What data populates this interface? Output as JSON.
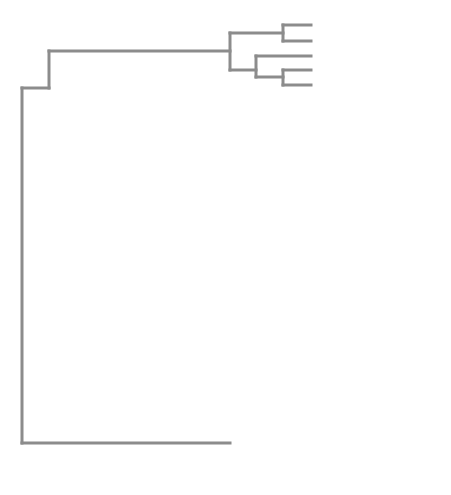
{
  "figure": {
    "type": "phylogenetic-tree",
    "colors": {
      "branch": "#8c8c8c",
      "highlight_branch": "#1a1a1a",
      "marker_filled": "#111111",
      "marker_grey": "#aaaaaa",
      "marker_open": "#ffffff"
    }
  },
  "leaves": [
    {
      "name": "agelas",
      "quoted": false,
      "suffix": "",
      "marker": "none",
      "y": 25
    },
    {
      "name": "mcclendoni",
      "quoted": false,
      "suffix": "",
      "marker": "none",
      "y": 41
    },
    {
      "name": "pectiniger",
      "quoted": false,
      "suffix": "",
      "marker": "open",
      "y": 56
    },
    {
      "name": "sanctithomae",
      "quoted": false,
      "suffix": "",
      "marker": "open",
      "y": 70
    },
    {
      "name": "williamsi",
      "quoted": false,
      "suffix": "",
      "marker": "open",
      "y": 85
    },
    {
      "name": "anasimus",
      "quoted": false,
      "suffix": "",
      "marker": "none",
      "y": 100
    },
    {
      "name": "occidentalis (?)",
      "quoted": false,
      "suffix": "",
      "marker": "none",
      "y": 115
    },
    {
      "name": "goodei",
      "quoted": false,
      "suffix": "",
      "marker": "open",
      "y": 130
    },
    {
      "name": "pandionis",
      "quoted": true,
      "suffix": " giant",
      "marker": "open",
      "y": 145
    },
    {
      "name": "pandionis",
      "quoted": true,
      "suffix": " red",
      "marker": "none",
      "y": 160
    },
    {
      "name": "pandionis",
      "quoted": false,
      "suffix": "",
      "marker": "open",
      "y": 175
    },
    {
      "name": "longicarpus",
      "quoted": false,
      "suffix": "",
      "marker": "open",
      "y": 190
    },
    {
      "name": "pandionis",
      "quoted": true,
      "suffix": " small",
      "marker": "open",
      "y": 205
    },
    {
      "name": "longicarpus",
      "quoted": true,
      "suffix": " small",
      "marker": "none",
      "y": 220
    },
    {
      "name": "filidigitus",
      "quoted": false,
      "suffix": "",
      "marker": "filled",
      "y": 234
    },
    {
      "name": "regalis",
      "quoted": false,
      "suffix": "",
      "marker": "filled",
      "y": 249
    },
    {
      "name": "rathbunae",
      "quoted": true,
      "suffix": " A",
      "marker": "filled",
      "y": 264
    },
    {
      "name": "rathbunae",
      "quoted": false,
      "suffix": "",
      "marker": "filled",
      "y": 279
    },
    {
      "name": "bousfieldi",
      "quoted": true,
      "suffix": " A",
      "marker": "none",
      "y": 294
    },
    {
      "name": "bousfieldi",
      "quoted": true,
      "suffix": " blade",
      "marker": "none",
      "y": 309
    },
    {
      "name": "chacei",
      "quoted": false,
      "suffix": "",
      "marker": "filled",
      "y": 323
    },
    {
      "name": "chacei",
      "quoted": true,
      "suffix": " A",
      "marker": "none",
      "y": 338
    },
    {
      "name": "brooksi",
      "quoted": true,
      "suffix": " D",
      "marker": "grey",
      "y": 353
    },
    {
      "name": "brooksi",
      "quoted": false,
      "suffix": "",
      "marker": "filled",
      "y": 368
    },
    {
      "name": "brevifrons",
      "quoted": false,
      "suffix": "",
      "marker": "none",
      "y": 383
    },
    {
      "name": "herricki",
      "quoted": false,
      "suffix": "",
      "marker": "none",
      "y": 397
    },
    {
      "name": "androsi",
      "quoted": false,
      "suffix": "",
      "marker": "open",
      "y": 412
    },
    {
      "name": "gambarelloides",
      "quoted": false,
      "suffix": "",
      "marker": "none",
      "y": 427
    },
    {
      "name": "intermediate",
      "quoted": true,
      "suffix": "",
      "marker": "none",
      "y": 441
    },
    {
      "name": "paraneptunus",
      "quoted": false,
      "suffix": "",
      "marker": "open",
      "y": 456
    },
    {
      "name": "paraneptunus",
      "quoted": true,
      "suffix": " small",
      "marker": "none",
      "y": 471
    }
  ],
  "support_values": [
    {
      "value": "60",
      "x": 263,
      "y": 29
    },
    {
      "value": "85",
      "x": 263,
      "y": 77
    },
    {
      "value": "77",
      "x": 106,
      "y": 42
    },
    {
      "value": "100",
      "x": 234,
      "y": 164
    },
    {
      "value": "99",
      "x": 269,
      "y": 238
    },
    {
      "value": "100",
      "x": 233,
      "y": 256
    },
    {
      "value": "100",
      "x": 259,
      "y": 270
    },
    {
      "value": "53",
      "x": 210,
      "y": 310
    },
    {
      "value": "100",
      "x": 263,
      "y": 314
    },
    {
      "value": "100",
      "x": 236,
      "y": 327
    },
    {
      "value": "92",
      "x": 181,
      "y": 336
    },
    {
      "value": "81",
      "x": 263,
      "y": 360
    },
    {
      "value": "94",
      "x": 237,
      "y": 452
    },
    {
      "value": "100",
      "x": 263,
      "y": 465
    }
  ],
  "branches": [
    {
      "d": "M49 51 V443 M49 51 H230 M49 443 H230",
      "dark": false
    },
    {
      "d": "M230 33 V70 M230 33 H283 M230 70 H256",
      "dark": false
    },
    {
      "d": "M283 25 V41 M283 25 H311 M283 41 H311",
      "dark": false
    },
    {
      "d": "M256 56 V77 M256 56 H311 M256 77 H283",
      "dark": false
    },
    {
      "d": "M283 70 V85 M283 70 H311 M283 85 H311",
      "dark": false
    },
    {
      "d": "M22 88 V413 M22 88 H49 M22 413 H49",
      "dark": false
    },
    {
      "d": "M49 88 H49",
      "dark": false
    },
    {
      "d": "M102 47 V193 M102 47 H126 M102 193 H76",
      "dark": false
    },
    {
      "d": "M126 22 V76 M126 22 H311 M126 76 H152",
      "dark": false
    },
    {
      "d": "M152 37 V113 M152 37 H311 M152 113 H179",
      "dark": false
    },
    {
      "d": "M179 89 V135 M179 89 H204 M179 135 H204",
      "dark": false
    },
    {
      "d": "M204 68 V113 M204 68 H230 M204 113 H311",
      "dark": false
    },
    {
      "d": "M230 51 V88 M230 51 H311 M230 88 H256",
      "dark": false
    },
    {
      "d": "M256 66 V97 M256 66 H283 M256 97 H311",
      "dark": false
    },
    {
      "d": "M283 66 V82 M283 66 H311 M283 82 H311",
      "dark": false
    },
    {
      "d": "M283 126 V142 M283 126 H311 M283 142 H311",
      "dark": false
    },
    {
      "d": "M76 113 V288 M76 113 H102 M76 288 H102",
      "dark": false
    },
    {
      "d": "M102 260 V288",
      "dark": false
    }
  ]
}
